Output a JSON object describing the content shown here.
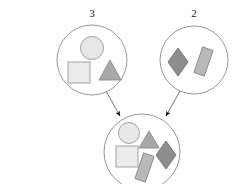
{
  "diagram": {
    "type": "set-union-diagram",
    "background_color": "#ffffff",
    "outline_color": "#8c8c8c",
    "arrow_color": "#1a1a1a",
    "sets": [
      {
        "id": "set-left",
        "label": "3",
        "label_x": 92,
        "label_y": 16,
        "cx": 92,
        "cy": 60,
        "r": 35,
        "count": 3,
        "shapes": [
          {
            "name": "circle",
            "fill": "#e8e8e8",
            "stroke": "#9a9a9a"
          },
          {
            "name": "square",
            "fill": "#ececec",
            "stroke": "#9a9a9a"
          },
          {
            "name": "triangle",
            "fill": "#a8a8a8",
            "stroke": "#8a8a8a"
          }
        ]
      },
      {
        "id": "set-right",
        "label": "2",
        "label_x": 194,
        "label_y": 16,
        "cx": 194,
        "cy": 60,
        "r": 34,
        "count": 2,
        "shapes": [
          {
            "name": "diamond",
            "fill": "#8d8d8d",
            "stroke": "#6f6f6f"
          },
          {
            "name": "tilted-rectangle",
            "fill": "#b9b9b9",
            "stroke": "#8a8a8a"
          }
        ]
      },
      {
        "id": "set-union",
        "label": "",
        "cx": 142,
        "cy": 152,
        "r": 38,
        "count": 5,
        "shapes": [
          {
            "name": "circle",
            "fill": "#e8e8e8",
            "stroke": "#9a9a9a"
          },
          {
            "name": "triangle",
            "fill": "#a8a8a8",
            "stroke": "#8a8a8a"
          },
          {
            "name": "square",
            "fill": "#ececec",
            "stroke": "#9a9a9a"
          },
          {
            "name": "diamond",
            "fill": "#8d8d8d",
            "stroke": "#6f6f6f"
          },
          {
            "name": "tilted-rectangle",
            "fill": "#b9b9b9",
            "stroke": "#8a8a8a"
          }
        ]
      }
    ],
    "arrows": [
      {
        "id": "arrow-left-to-union",
        "from": "set-left",
        "to": "set-union",
        "x1": 106,
        "y1": 91,
        "x2": 120,
        "y2": 117
      },
      {
        "id": "arrow-right-to-union",
        "from": "set-right",
        "to": "set-union",
        "x1": 180,
        "y1": 91,
        "x2": 165,
        "y2": 117
      }
    ]
  }
}
